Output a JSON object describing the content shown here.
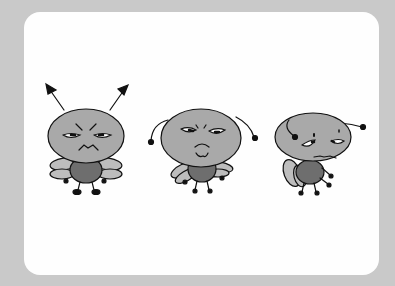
{
  "illustration": {
    "description": "Three cartoon flies with grumpy, sad, and worried faces",
    "background_color": "#c9c9c9",
    "card_color": "#fefefe",
    "head_color": "#a9a9a9",
    "body_color": "#6e6e6e",
    "characters": [
      {
        "name": "angry-fly",
        "expression": "angry"
      },
      {
        "name": "sad-fly",
        "expression": "sad"
      },
      {
        "name": "worried-fly",
        "expression": "worried"
      }
    ]
  }
}
